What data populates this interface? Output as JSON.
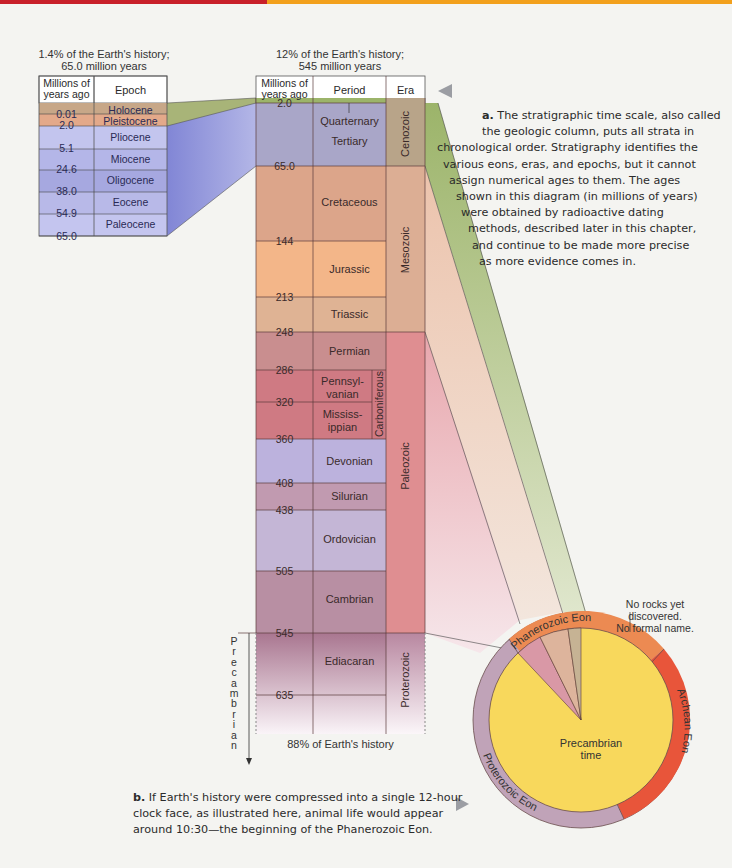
{
  "header_bar": {
    "left_color": "#c8202a",
    "right_color": "#f2a01c"
  },
  "chart_data": {
    "type": "table",
    "epoch_table": {
      "caption_line1": "1.4% of the Earth's history;",
      "caption_line2": "65.0 million years",
      "columns": [
        "Millions of years ago",
        "Epoch"
      ],
      "col1_line1": "Millions of",
      "col1_line2": "years ago",
      "col2": "Epoch",
      "ticks": [
        "0.01",
        "2.0",
        "5.1",
        "24.6",
        "38.0",
        "54.9",
        "65.0"
      ],
      "rows": [
        {
          "epoch": "Holocene",
          "color": "#c7a788"
        },
        {
          "epoch": "Pleistocene",
          "color": "#e3a98a"
        },
        {
          "epoch": "Pliocene",
          "color": "#c3c5ee"
        },
        {
          "epoch": "Miocene",
          "color": "#b4b6e8"
        },
        {
          "epoch": "Oligocene",
          "color": "#a6a8e0"
        },
        {
          "epoch": "Eocene",
          "color": "#b8b9e8"
        },
        {
          "epoch": "Paleocene",
          "color": "#c4c5ef"
        }
      ]
    },
    "period_table": {
      "caption_line1": "12% of the Earth's history;",
      "caption_line2": "545 million years",
      "col1_line1": "Millions of",
      "col1_line2": "years ago",
      "col2": "Period",
      "col3": "Era",
      "ticks": [
        "2.0",
        "65.0",
        "144",
        "213",
        "248",
        "286",
        "320",
        "360",
        "408",
        "438",
        "505",
        "545",
        "635"
      ],
      "periods": [
        {
          "name": "Quarternary",
          "color": "#a9a6c8"
        },
        {
          "name": "Tertiary",
          "color": "#a9a6c8"
        },
        {
          "name": "Cretaceous",
          "color": "#dca58a"
        },
        {
          "name": "Jurassic",
          "color": "#f3b689"
        },
        {
          "name": "Triassic",
          "color": "#dfb394"
        },
        {
          "name": "Permian",
          "color": "#c98e8f"
        },
        {
          "name": "Pennsyl-",
          "name2": "vanian",
          "color": "#cf7a83"
        },
        {
          "name": "Mississ-",
          "name2": "ippian",
          "color": "#cf7a83"
        },
        {
          "name": "Devonian",
          "color": "#bcb2dd"
        },
        {
          "name": "Silurian",
          "color": "#c19ab0"
        },
        {
          "name": "Ordovician",
          "color": "#c4b6d6"
        },
        {
          "name": "Cambrian",
          "color": "#b88fa3"
        },
        {
          "name": "Ediacaran",
          "color": "#b58aa2"
        }
      ],
      "subgroup": "Carboniferous",
      "eras": [
        {
          "name": "Cenozoic",
          "color": "#b8a489"
        },
        {
          "name": "Mesozoic",
          "color": "#dcae94"
        },
        {
          "name": "Paleozoic",
          "color": "#df8e91"
        },
        {
          "name": "Proterozoic",
          "color": "#c3a1b6"
        }
      ],
      "precambrian_label": "Precambrian",
      "footer": "88% of Earth's history"
    },
    "clock": {
      "center_label_line1": "Precambrian",
      "center_label_line2": "time",
      "ring_segments": [
        "Phanerozoic Eon",
        "Archean Eon",
        "Proterozoic Eon"
      ],
      "note_line1": "No rocks yet",
      "note_line2": "discovered.",
      "note_line3": "No formal name.",
      "colors": {
        "precambrian": "#f8d85c",
        "hadean": "#ec8a52",
        "archean": "#e8553a",
        "proterozoic": "#c0a3b8",
        "phanerozoic": "#ec8a52"
      }
    }
  },
  "captions": {
    "a_label": "a.",
    "a_lines": [
      " The stratigraphic time scale, also called",
      "the geologic column, puts all strata in",
      "chronological order. Stratigraphy identifies the",
      "various eons, eras, and epochs, but it cannot",
      "assign numerical ages to them. The ages",
      "shown in this diagram (in millions of years)",
      "were obtained by radioactive dating",
      "methods, described later in this chapter,",
      "and continue to be made more precise",
      "as more evidence comes in."
    ],
    "b_label": "b.",
    "b_lines": [
      " If Earth's history were compressed into a single 12-hour",
      "clock face, as illustrated here, animal life would appear",
      "around 10:30—the beginning of the Phanerozoic Eon."
    ]
  }
}
